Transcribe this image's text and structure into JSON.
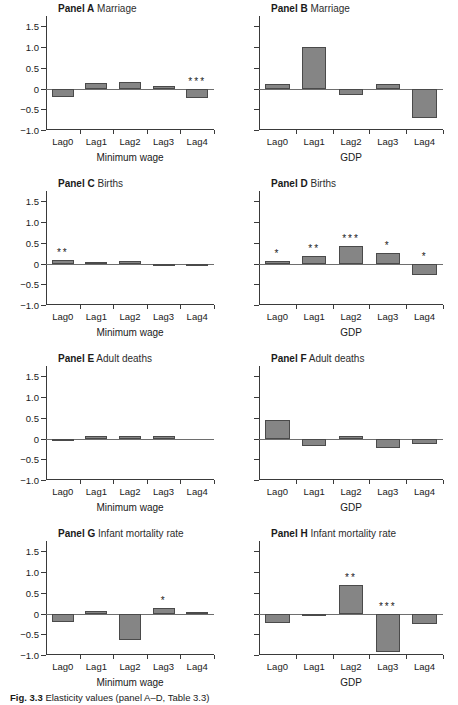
{
  "figure": {
    "caption_label": "Fig. 3.3",
    "caption_text": "Elasticity values (panel A–D, Table 3.3)"
  },
  "axis": {
    "y_ticks": [
      1.5,
      1.0,
      0.5,
      0,
      -0.5,
      -1.0
    ],
    "y_tick_labels": [
      "1.5",
      "1.0",
      "0.5",
      "0",
      "-0.5",
      "-1.0"
    ],
    "ylim": [
      -1.0,
      1.75
    ],
    "categories": [
      "Lag0",
      "Lag1",
      "Lag2",
      "Lag3",
      "Lag4"
    ],
    "xlabel_left": "Minimum wage",
    "xlabel_right": "GDP"
  },
  "chart_data": {
    "type": "bar",
    "xlabel": "Lag",
    "ylabel": "Elasticity",
    "ylim": [
      -1.0,
      1.75
    ],
    "grid": false,
    "legend": "none",
    "categories": [
      "Lag0",
      "Lag1",
      "Lag2",
      "Lag3",
      "Lag4"
    ],
    "significance_note": "Asterisks denote statistical significance levels",
    "panels": [
      {
        "id": "A",
        "panel_label": "Panel A",
        "outcome": "Marriage",
        "regressor": "Minimum wage",
        "column": "left",
        "values": [
          -0.2,
          0.13,
          0.15,
          0.05,
          -0.23
        ],
        "stars": [
          "",
          "",
          "",
          "",
          "***"
        ]
      },
      {
        "id": "B",
        "panel_label": "Panel B",
        "outcome": "Marriage",
        "regressor": "GDP",
        "column": "right",
        "values": [
          0.1,
          1.0,
          -0.15,
          0.12,
          -0.72
        ],
        "stars": [
          "",
          "",
          "",
          "",
          ""
        ]
      },
      {
        "id": "C",
        "panel_label": "Panel C",
        "outcome": "Births",
        "regressor": "Minimum wage",
        "column": "left",
        "values": [
          0.08,
          0.04,
          0.05,
          -0.03,
          -0.03
        ],
        "stars": [
          "**",
          "",
          "",
          "",
          ""
        ]
      },
      {
        "id": "D",
        "panel_label": "Panel D",
        "outcome": "Births",
        "regressor": "GDP",
        "column": "right",
        "values": [
          0.07,
          0.18,
          0.43,
          0.25,
          -0.28
        ],
        "stars": [
          "*",
          "**",
          "***",
          "*",
          "*"
        ]
      },
      {
        "id": "E",
        "panel_label": "Panel E",
        "outcome": "Adult deaths",
        "regressor": "Minimum wage",
        "column": "left",
        "values": [
          -0.06,
          0.06,
          0.05,
          0.05,
          0.0
        ],
        "stars": [
          "",
          "",
          "",
          "",
          ""
        ]
      },
      {
        "id": "F",
        "panel_label": "Panel F",
        "outcome": "Adult deaths",
        "regressor": "GDP",
        "column": "right",
        "values": [
          0.45,
          -0.17,
          0.07,
          -0.22,
          -0.13
        ],
        "stars": [
          "",
          "",
          "",
          "",
          ""
        ]
      },
      {
        "id": "G",
        "panel_label": "Panel G",
        "outcome": "Infant mortality rate",
        "regressor": "Minimum wage",
        "column": "left",
        "values": [
          -0.21,
          0.05,
          -0.64,
          0.14,
          0.04
        ],
        "stars": [
          "",
          "",
          "",
          "*",
          ""
        ]
      },
      {
        "id": "H",
        "panel_label": "Panel H",
        "outcome": "Infant mortality rate",
        "regressor": "GDP",
        "column": "right",
        "values": [
          -0.22,
          -0.04,
          0.7,
          -0.93,
          -0.25
        ],
        "stars": [
          "",
          "",
          "**",
          "***",
          ""
        ]
      }
    ]
  },
  "colors": {
    "bar_fill": "#858585",
    "bar_stroke": "#4a4a4a",
    "axis": "#3a3a3a",
    "zero_line": "#6e6e6e",
    "text": "#1a1a1a"
  }
}
